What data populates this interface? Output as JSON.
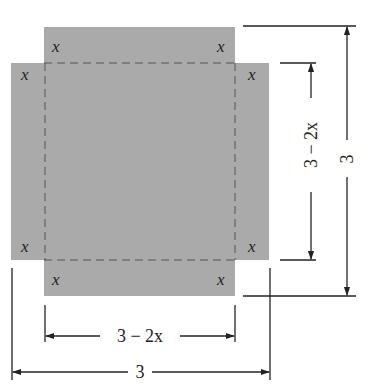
{
  "diagram": {
    "fill_color": "#aaaaaa",
    "line_color": "#222222",
    "corner_labels": [
      "x",
      "x",
      "x",
      "x",
      "x",
      "x",
      "x",
      "x"
    ],
    "dimensions": {
      "inner_width_label": "3 − 2x",
      "outer_width_label": "3",
      "inner_height_label": "3 − 2x",
      "outer_height_label": "3"
    }
  }
}
